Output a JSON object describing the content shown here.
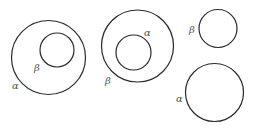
{
  "diagram": {
    "stroke_color": "#2a2a2a",
    "label_color": "#555555",
    "panels": [
      {
        "id": "beta-inside-alpha",
        "circles": [
          {
            "name": "alpha",
            "label": "α",
            "cx": 48.5,
            "cy": 57.5,
            "r": 37,
            "label_x": 12,
            "label_y": 89
          },
          {
            "name": "beta",
            "label": "β",
            "cx": 57,
            "cy": 50,
            "r": 17,
            "label_x": 34,
            "label_y": 71
          }
        ]
      },
      {
        "id": "alpha-inside-beta",
        "circles": [
          {
            "name": "beta",
            "label": "β",
            "cx": 137.5,
            "cy": 46,
            "r": 36,
            "label_x": 105,
            "label_y": 84
          },
          {
            "name": "alpha",
            "label": "α",
            "cx": 133.5,
            "cy": 52.5,
            "r": 17.5,
            "label_x": 144,
            "label_y": 36
          }
        ]
      },
      {
        "id": "separate",
        "circles": [
          {
            "name": "beta",
            "label": "β",
            "cx": 218,
            "cy": 28.5,
            "r": 19,
            "label_x": 189,
            "label_y": 33
          },
          {
            "name": "alpha",
            "label": "α",
            "cx": 214.5,
            "cy": 92.5,
            "r": 29,
            "label_x": 176,
            "label_y": 102
          }
        ]
      }
    ]
  }
}
